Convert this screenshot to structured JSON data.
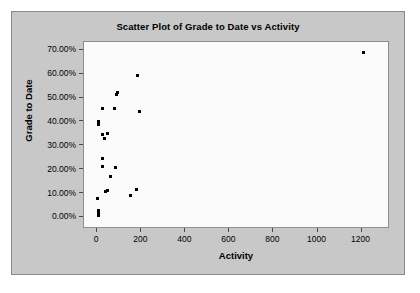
{
  "chart_data": {
    "type": "scatter",
    "title": "Scatter Plot of Grade to Date vs Activity",
    "xlabel": "Activity",
    "ylabel": "Grade to Date",
    "xlim": [
      -60,
      1320
    ],
    "ylim": [
      -0.04,
      0.735
    ],
    "grid": false,
    "legend": null,
    "xticks": [
      0,
      200,
      400,
      600,
      800,
      1000,
      1200
    ],
    "xtick_labels": [
      "0",
      "200",
      "400",
      "600",
      "800",
      "1000",
      "1200"
    ],
    "yticks": [
      0.0,
      0.1,
      0.2,
      0.3,
      0.4,
      0.5,
      0.6,
      0.7
    ],
    "ytick_labels": [
      "0.00%",
      "10.00%",
      "20.00%",
      "30.00%",
      "40.00%",
      "50.00%",
      "60.00%",
      "70.00%"
    ],
    "marker": "square",
    "marker_color": "#000000",
    "points": [
      {
        "x": 6,
        "y": 0.008
      },
      {
        "x": 6,
        "y": 0.018
      },
      {
        "x": 6,
        "y": 0.028
      },
      {
        "x": 3,
        "y": 0.079
      },
      {
        "x": 37,
        "y": 0.11
      },
      {
        "x": 47,
        "y": 0.113
      },
      {
        "x": 150,
        "y": 0.091
      },
      {
        "x": 180,
        "y": 0.118
      },
      {
        "x": 60,
        "y": 0.17
      },
      {
        "x": 83,
        "y": 0.211
      },
      {
        "x": 25,
        "y": 0.215
      },
      {
        "x": 26,
        "y": 0.246
      },
      {
        "x": 32,
        "y": 0.331
      },
      {
        "x": 26,
        "y": 0.348
      },
      {
        "x": 47,
        "y": 0.352
      },
      {
        "x": 7,
        "y": 0.388
      },
      {
        "x": 7,
        "y": 0.397
      },
      {
        "x": 8,
        "y": 0.404
      },
      {
        "x": 192,
        "y": 0.442
      },
      {
        "x": 24,
        "y": 0.456
      },
      {
        "x": 80,
        "y": 0.458
      },
      {
        "x": 88,
        "y": 0.516
      },
      {
        "x": 90,
        "y": 0.524
      },
      {
        "x": 183,
        "y": 0.596
      },
      {
        "x": 1210,
        "y": 0.692
      }
    ]
  },
  "colors": {
    "panel_background": "#c8c8c8",
    "plot_background": "#fbfbfb",
    "axis": "#4a4a4a",
    "text": "#000000",
    "marker": "#000000"
  }
}
